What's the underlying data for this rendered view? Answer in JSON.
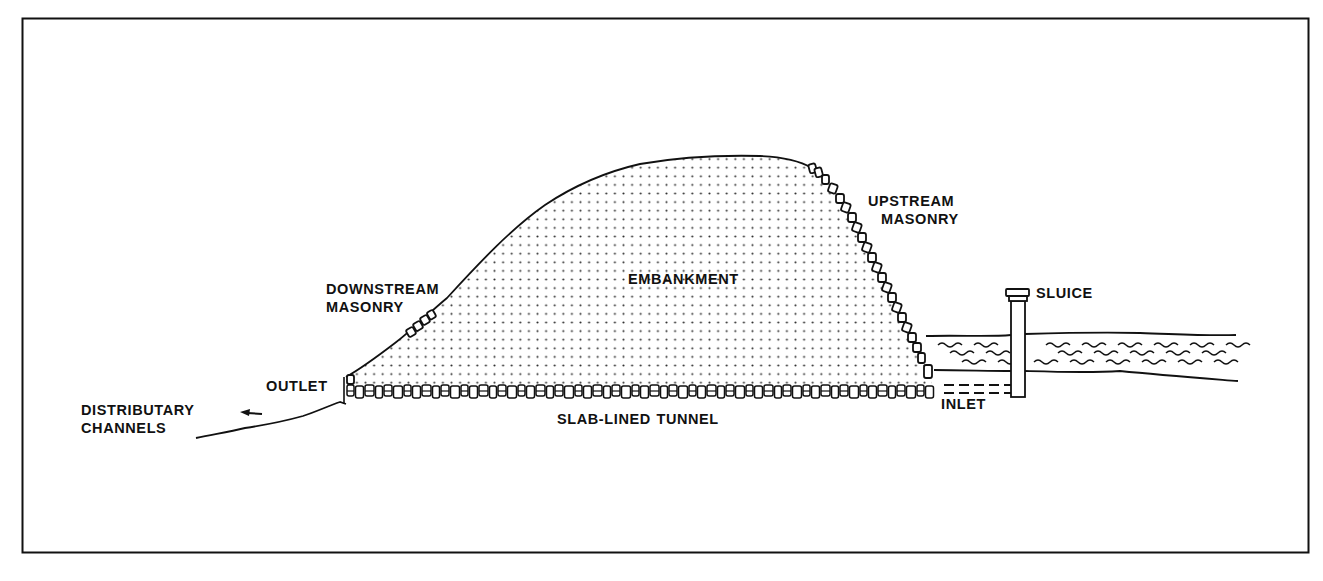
{
  "figure": {
    "type": "cross-section diagram",
    "colors": {
      "ink": "#111111",
      "background": "#ffffff",
      "stipple": "#333333"
    }
  },
  "labels": {
    "upstream_masonry": [
      "UPSTREAM",
      "MASONRY"
    ],
    "downstream_masonry": [
      "DOWNSTREAM",
      "MASONRY"
    ],
    "embankment": "EMBANKMENT",
    "sluice": "SLUICE",
    "outlet": "OUTLET",
    "inlet": "INLET",
    "tunnel": "SLAB-LINED TUNNEL",
    "distributary": [
      "DISTRIBUTARY",
      "CHANNELS"
    ]
  },
  "components": [
    {
      "id": "embankment",
      "description": "stippled earthen mound"
    },
    {
      "id": "downstream-masonry",
      "description": "stone blocks on downstream face"
    },
    {
      "id": "upstream-masonry",
      "description": "stone blocks on upstream face"
    },
    {
      "id": "slab-lined-tunnel",
      "description": "row of slabs along base"
    },
    {
      "id": "sluice",
      "description": "vertical gate column in reservoir"
    },
    {
      "id": "reservoir",
      "description": "water with wave marks behind dam"
    },
    {
      "id": "distributary-arrow",
      "description": "arrow pointing left to channels"
    }
  ]
}
